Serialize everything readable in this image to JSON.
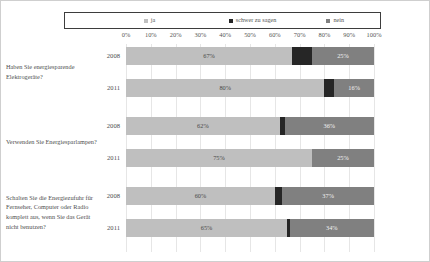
{
  "chart_data": {
    "type": "bar",
    "orientation": "horizontal",
    "stacked": true,
    "stacked_percent": true,
    "title": "",
    "subtitle": "",
    "xlabel": "",
    "ylabel": "",
    "xlim": [
      0,
      100
    ],
    "xtick_labels": [
      "0%",
      "10%",
      "20%",
      "30%",
      "40%",
      "50%",
      "60%",
      "70%",
      "80%",
      "90%",
      "100%"
    ],
    "xtick_values": [
      0,
      10,
      20,
      30,
      40,
      50,
      60,
      70,
      80,
      90,
      100
    ],
    "grid": true,
    "legend_position": "top",
    "legend": [
      {
        "label": "ja",
        "color": "#bfbfbf"
      },
      {
        "label": "schwer zu sagen",
        "color": "#262626"
      },
      {
        "label": "nein",
        "color": "#808080"
      }
    ],
    "series": [
      {
        "name": "ja",
        "color": "#bfbfbf",
        "values": [
          67,
          80,
          62,
          75,
          60,
          65
        ]
      },
      {
        "name": "schwer zu sagen",
        "color": "#262626",
        "values": [
          8,
          4,
          2,
          0,
          3,
          1
        ]
      },
      {
        "name": "nein",
        "color": "#808080",
        "values": [
          25,
          16,
          36,
          25,
          37,
          34
        ]
      }
    ],
    "groups": [
      {
        "question": "Haben Sie energiesparende Elektrogeräte?",
        "rows": [
          {
            "year": "2008",
            "segments": [
              {
                "series": "ja",
                "value": 67,
                "label": "67%"
              },
              {
                "series": "schwer zu sagen",
                "value": 8,
                "label": ""
              },
              {
                "series": "nein",
                "value": 25,
                "label": "25%"
              }
            ]
          },
          {
            "year": "2011",
            "segments": [
              {
                "series": "ja",
                "value": 80,
                "label": "80%"
              },
              {
                "series": "schwer zu sagen",
                "value": 4,
                "label": ""
              },
              {
                "series": "nein",
                "value": 16,
                "label": "16%"
              }
            ]
          }
        ]
      },
      {
        "question": "Verwenden Sie Energiesparlampen?",
        "rows": [
          {
            "year": "2008",
            "segments": [
              {
                "series": "ja",
                "value": 62,
                "label": "62%"
              },
              {
                "series": "schwer zu sagen",
                "value": 2,
                "label": ""
              },
              {
                "series": "nein",
                "value": 36,
                "label": "36%"
              }
            ]
          },
          {
            "year": "2011",
            "segments": [
              {
                "series": "ja",
                "value": 75,
                "label": "75%"
              },
              {
                "series": "schwer zu sagen",
                "value": 0,
                "label": ""
              },
              {
                "series": "nein",
                "value": 25,
                "label": "25%"
              }
            ]
          }
        ]
      },
      {
        "question": "Schalten Sie die Energiezufuhr für Fernseher, Computer oder Radio komplett aus, wenn Sie das Gerät nicht benutzen?",
        "rows": [
          {
            "year": "2008",
            "segments": [
              {
                "series": "ja",
                "value": 60,
                "label": "60%"
              },
              {
                "series": "schwer zu sagen",
                "value": 3,
                "label": ""
              },
              {
                "series": "nein",
                "value": 37,
                "label": "37%"
              }
            ]
          },
          {
            "year": "2011",
            "segments": [
              {
                "series": "ja",
                "value": 65,
                "label": "65%"
              },
              {
                "series": "schwer zu sagen",
                "value": 1,
                "label": ""
              },
              {
                "series": "nein",
                "value": 34,
                "label": "34%"
              }
            ]
          }
        ]
      }
    ]
  }
}
